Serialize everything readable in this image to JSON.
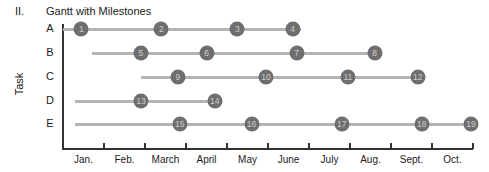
{
  "header": {
    "section_number": "II.",
    "title": "Gantt with Milestones"
  },
  "chart_data": {
    "type": "gantt",
    "title": "Gantt with Milestones",
    "xlabel": "",
    "ylabel": "Task",
    "months": [
      "Jan.",
      "Feb.",
      "March",
      "April",
      "May",
      "June",
      "July",
      "Aug.",
      "Sept.",
      "Oct."
    ],
    "tasks": [
      {
        "name": "A",
        "start": 0.0,
        "end": 5.8,
        "milestones": [
          {
            "id": "1",
            "at": 0.45
          },
          {
            "id": "2",
            "at": 2.4
          },
          {
            "id": "3",
            "at": 4.25
          },
          {
            "id": "4",
            "at": 5.6
          }
        ]
      },
      {
        "name": "B",
        "start": 0.7,
        "end": 7.6,
        "milestones": [
          {
            "id": "5",
            "at": 1.9
          },
          {
            "id": "6",
            "at": 3.5
          },
          {
            "id": "7",
            "at": 5.7
          },
          {
            "id": "8",
            "at": 7.6
          }
        ]
      },
      {
        "name": "C",
        "start": 1.9,
        "end": 8.6,
        "milestones": [
          {
            "id": "9",
            "at": 2.8
          },
          {
            "id": "10",
            "at": 4.95
          },
          {
            "id": "11",
            "at": 6.95
          },
          {
            "id": "12",
            "at": 8.65
          }
        ]
      },
      {
        "name": "D",
        "start": 0.3,
        "end": 3.7,
        "milestones": [
          {
            "id": "13",
            "at": 1.9
          },
          {
            "id": "14",
            "at": 3.7
          }
        ]
      },
      {
        "name": "E",
        "start": 0.3,
        "end": 9.9,
        "milestones": [
          {
            "id": "15",
            "at": 2.85
          },
          {
            "id": "16",
            "at": 4.6
          },
          {
            "id": "17",
            "at": 6.8
          },
          {
            "id": "18",
            "at": 8.75
          },
          {
            "id": "19",
            "at": 9.95
          }
        ]
      }
    ],
    "colors": {
      "bar": "#b4b4b4",
      "milestone": "#6e6e6e",
      "milestone_text": "#cfcfcf",
      "axis": "#333333"
    }
  }
}
